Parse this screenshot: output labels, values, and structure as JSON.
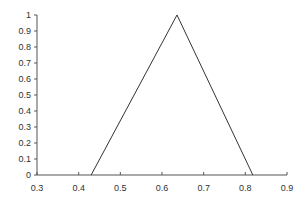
{
  "chart_data": {
    "type": "line",
    "title": "",
    "xlabel": "",
    "ylabel": "",
    "xlim": [
      0.3,
      0.9
    ],
    "ylim": [
      0,
      1
    ],
    "grid": false,
    "legend": null,
    "x_ticks": [
      "0.3",
      "0.4",
      "0.5",
      "0.6",
      "0.7",
      "0.8",
      "0.9"
    ],
    "y_ticks": [
      "0",
      "0.1",
      "0.2",
      "0.3",
      "0.4",
      "0.5",
      "0.6",
      "0.7",
      "0.8",
      "0.9",
      "1"
    ],
    "series": [
      {
        "name": "triangular membership",
        "x": [
          0.43,
          0.636,
          0.818
        ],
        "y": [
          0,
          1,
          0
        ],
        "color": "#333333"
      }
    ]
  }
}
